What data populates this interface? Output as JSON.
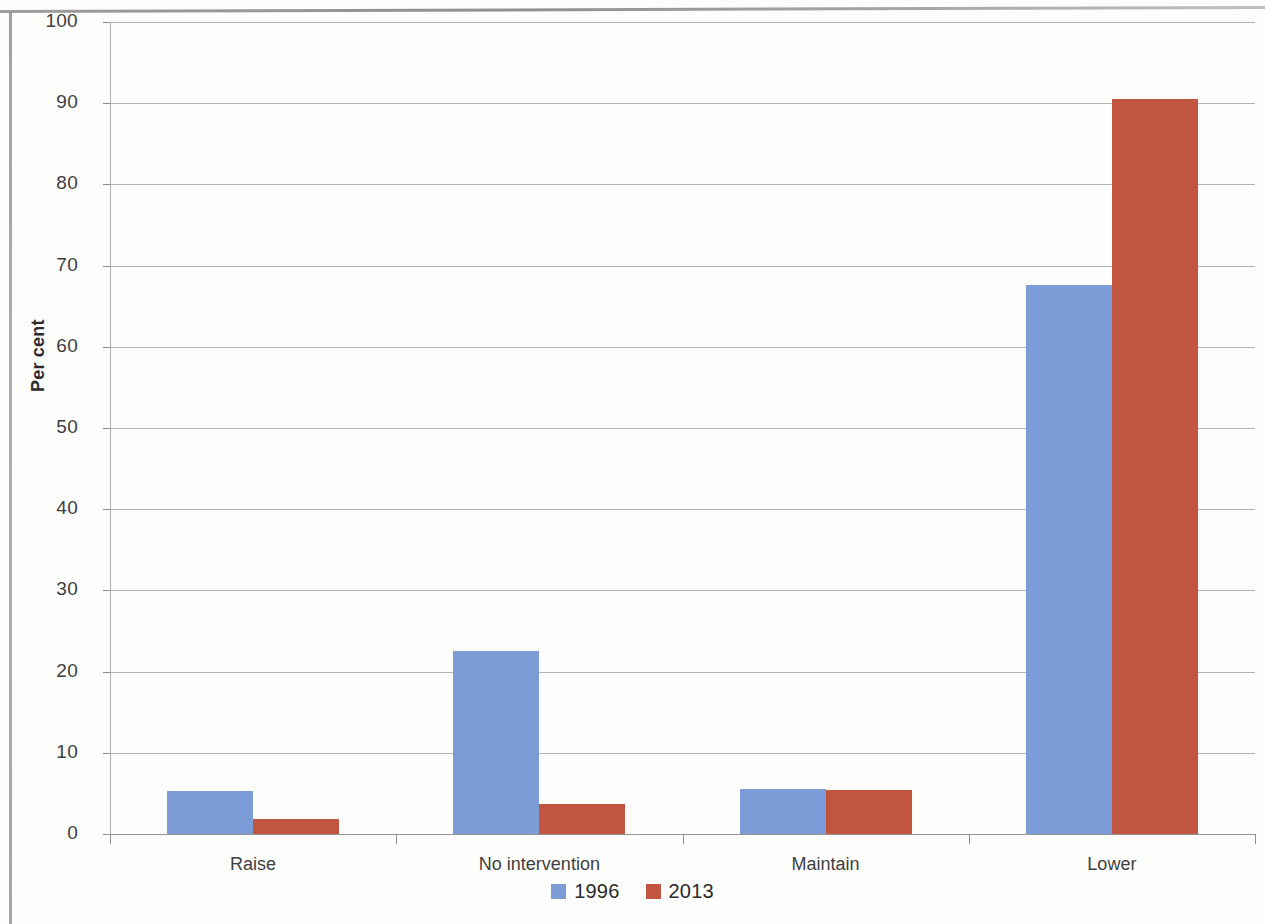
{
  "chart_data": {
    "type": "bar",
    "title": "",
    "subtitle": "",
    "xlabel": "",
    "ylabel": "Per cent",
    "ylim": [
      0,
      100
    ],
    "ytick_step": 10,
    "yticks": [
      "100",
      "90",
      "80",
      "70",
      "60",
      "50",
      "40",
      "30",
      "20",
      "10",
      "0"
    ],
    "grid": true,
    "legend_position": "bottom",
    "categories": [
      "Raise",
      "No intervention",
      "Maintain",
      "Lower"
    ],
    "series": [
      {
        "name": "1996",
        "color": "#7b9cd7",
        "values": [
          5.3,
          22.6,
          5.6,
          67.6
        ]
      },
      {
        "name": "2013",
        "color": "#c2553f",
        "values": [
          1.8,
          3.7,
          5.4,
          90.5
        ]
      }
    ]
  },
  "legend": {
    "items": [
      {
        "label": "1996",
        "color": "#7b9cd7"
      },
      {
        "label": "2013",
        "color": "#c2553f"
      }
    ]
  }
}
